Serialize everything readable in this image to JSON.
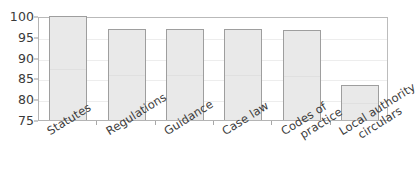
{
  "chart_data": {
    "type": "bar",
    "title": "",
    "xlabel": "",
    "ylabel": "",
    "ylim": [
      75,
      100
    ],
    "ytick_step": 5,
    "yticks": [
      100,
      95,
      90,
      85,
      80,
      75
    ],
    "grid": true,
    "legend": false,
    "categories": [
      "Statutes",
      "Regulations",
      "Guidance",
      "Case law",
      "Codes of practice",
      "Local authority circulars"
    ],
    "category_lines": [
      [
        "Statutes"
      ],
      [
        "Regulations"
      ],
      [
        "Guidance"
      ],
      [
        "Case law"
      ],
      [
        "Codes of",
        "practice"
      ],
      [
        "Local authority",
        "circulars"
      ]
    ],
    "values": [
      100,
      96.8,
      96.8,
      96.8,
      96.6,
      83.5
    ],
    "bar_fill": "#e9e9e9",
    "bar_border": "#9e9e9e",
    "frame_color": "#b4b4b4",
    "gridline_color": "#ededed",
    "text_color": "#3c3c3c"
  },
  "title_remnant": ""
}
